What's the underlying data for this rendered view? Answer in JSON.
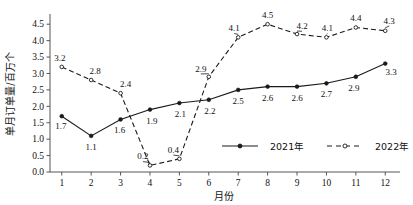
{
  "chart_data": {
    "type": "line",
    "title": "",
    "xlabel": "月份",
    "ylabel": "单月订单量/百万个",
    "categories": [
      "1",
      "2",
      "3",
      "4",
      "5",
      "6",
      "7",
      "8",
      "9",
      "10",
      "11",
      "12"
    ],
    "x": [
      1,
      2,
      3,
      4,
      5,
      6,
      7,
      8,
      9,
      10,
      11,
      12
    ],
    "xlim": [
      0.6,
      12.4
    ],
    "ylim": [
      0.0,
      4.75
    ],
    "yticks": [
      "0.0",
      "0.5",
      "1.0",
      "1.5",
      "2.0",
      "2.5",
      "3.0",
      "3.5",
      "4.0",
      "4.5"
    ],
    "ytick_values": [
      0.0,
      0.5,
      1.0,
      1.5,
      2.0,
      2.5,
      3.0,
      3.5,
      4.0,
      4.5
    ],
    "grid": false,
    "legend_position": "inside-bottom-right",
    "series": [
      {
        "name": "2021年",
        "style": "solid",
        "marker": "filled-circle",
        "color": "#1a1a1a",
        "values": [
          1.7,
          1.1,
          1.6,
          1.9,
          2.1,
          2.2,
          2.5,
          2.6,
          2.6,
          2.7,
          2.9,
          3.3
        ],
        "labels": [
          "1.7",
          "1.1",
          "1.6",
          "1.9",
          "2.1",
          "2.2",
          "2.5",
          "2.6",
          "2.6",
          "2.7",
          "2.9",
          "3.3"
        ]
      },
      {
        "name": "2022年",
        "style": "dashed",
        "marker": "open-circle",
        "color": "#1a1a1a",
        "values": [
          3.2,
          2.8,
          2.4,
          0.2,
          0.4,
          2.9,
          4.1,
          4.5,
          4.2,
          4.1,
          4.4,
          4.3
        ],
        "labels": [
          "3.2",
          "2.8",
          "2.4",
          "0.2",
          "0.4",
          "2.9",
          "4.1",
          "4.5",
          "4.2",
          "4.1",
          "4.4",
          "4.3"
        ]
      }
    ]
  },
  "legend": {
    "items": [
      {
        "label": "2021年",
        "style": "solid"
      },
      {
        "label": "2022年",
        "style": "dashed"
      }
    ]
  },
  "axes": {
    "x_title": "月份",
    "y_title": "单月订单量/百万个"
  }
}
